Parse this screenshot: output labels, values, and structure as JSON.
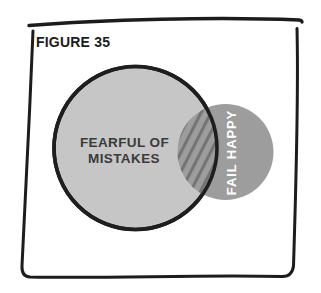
{
  "figure": {
    "label": "FIGURE 35"
  },
  "venn": {
    "large_circle": {
      "label_line1": "FEARFUL OF",
      "label_line2": "MISTAKES",
      "fill": "#c6c6c6",
      "outline": "#1e1e1e"
    },
    "small_circle": {
      "label": "FAIL HAPPY",
      "fill": "#9d9d9d",
      "label_color": "#ffffff"
    },
    "overlap": {
      "pattern": "diagonal-hatch",
      "hatch_color": "#747474"
    }
  },
  "frame": {
    "style": "hand-drawn-rectangle",
    "color": "#1c1c1c",
    "background": "#ffffff"
  }
}
